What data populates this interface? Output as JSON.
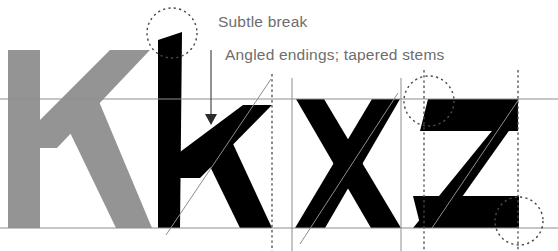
{
  "figure": {
    "name": "typeface-specimen-diagram",
    "background_color": "#ffffff",
    "width": 558,
    "height": 251
  },
  "annotations": [
    {
      "id": "subtle-break",
      "label": "Subtle break",
      "text_x": 218,
      "text_y": 27,
      "color": "#6d6d6d"
    },
    {
      "id": "angled-endings",
      "label": "Angled endings; tapered stems",
      "text_x": 225,
      "text_y": 60,
      "color": "#6d6d6d"
    }
  ],
  "glyphs": [
    {
      "id": "uppercase-k-ghost",
      "character": "K",
      "case": "uppercase",
      "color": "#949494",
      "role": "reference-ghost"
    },
    {
      "id": "lowercase-k",
      "character": "k",
      "case": "lowercase",
      "color": "#000000",
      "role": "specimen"
    },
    {
      "id": "lowercase-x",
      "character": "x",
      "case": "lowercase",
      "color": "#000000",
      "role": "specimen"
    },
    {
      "id": "lowercase-z",
      "character": "z",
      "case": "lowercase",
      "color": "#000000",
      "role": "specimen"
    }
  ],
  "guides": {
    "horizontal": [
      {
        "id": "x-height-line",
        "y": 99,
        "color": "#8d8d8d",
        "style": "solid"
      },
      {
        "id": "baseline",
        "y": 228,
        "color": "#8d8d8d",
        "style": "solid"
      }
    ],
    "vertical_solid": [
      {
        "id": "x-left-guide",
        "x": 292,
        "color": "#8d8d8d"
      },
      {
        "id": "x-right-guide",
        "x": 401,
        "color": "#8d8d8d"
      }
    ],
    "vertical_dotted": [
      {
        "id": "k-right-guide",
        "x": 272,
        "color": "#4a4a4a"
      },
      {
        "id": "z-left-guide",
        "x": 424,
        "color": "#4a4a4a"
      },
      {
        "id": "z-right-guide",
        "x": 518,
        "color": "#4a4a4a"
      }
    ],
    "diagonals": [
      {
        "id": "k-stress-axis",
        "x1": 166,
        "y1": 235,
        "x2": 271,
        "y2": 79,
        "color": "#8d8d8d"
      },
      {
        "id": "x-stress-axis",
        "x1": 300,
        "y1": 244,
        "x2": 398,
        "y2": 93,
        "color": "#8d8d8d"
      },
      {
        "id": "z-stress-axis",
        "x1": 432,
        "y1": 228,
        "x2": 519,
        "y2": 99,
        "color": "#8d8d8d"
      }
    ],
    "circles": [
      {
        "id": "k-ascender-highlight",
        "cx": 172,
        "cy": 33,
        "r": 25,
        "color": "#4a4a4a"
      },
      {
        "id": "z-top-left-highlight",
        "cx": 429,
        "cy": 101,
        "r": 25,
        "color": "#4a4a4a"
      },
      {
        "id": "z-bottom-right-highlight",
        "cx": 519,
        "cy": 221,
        "r": 24,
        "color": "#4a4a4a"
      }
    ],
    "arrow": {
      "id": "subtle-break-pointer",
      "x": 211,
      "y_start": 50,
      "y_end": 122,
      "color": "#4a4a4a"
    }
  }
}
